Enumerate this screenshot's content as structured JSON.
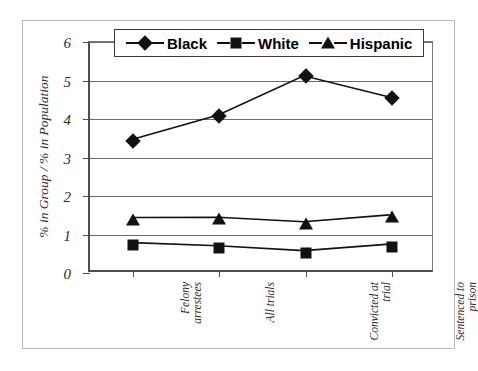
{
  "chart_data": {
    "type": "line",
    "title": "",
    "xlabel": "",
    "ylabel": "% in Group / % in Population",
    "ylim": [
      0,
      6
    ],
    "ytick_values": [
      0,
      1,
      2,
      3,
      4,
      5,
      6
    ],
    "ytick_labels": [
      "0",
      "1",
      "2",
      "3",
      "4",
      "5",
      "6"
    ],
    "grid": true,
    "legend_position": "top-center",
    "categories": [
      "Felony arrestees",
      "All trials",
      "Convicted at trial",
      "Sentenced to prison"
    ],
    "category_lines": [
      [
        "Felony",
        "arrestees"
      ],
      [
        "All trials"
      ],
      [
        "Convicted at",
        "trial"
      ],
      [
        "Sentenced to",
        "prison"
      ]
    ],
    "series": [
      {
        "name": "Black",
        "marker": "diamond",
        "color": "#111111",
        "values": [
          3.44,
          4.08,
          5.11,
          4.55
        ]
      },
      {
        "name": "White",
        "marker": "square",
        "color": "#111111",
        "values": [
          0.72,
          0.64,
          0.51,
          0.68
        ]
      },
      {
        "name": "Hispanic",
        "marker": "triangle",
        "color": "#111111",
        "values": [
          1.38,
          1.39,
          1.27,
          1.45
        ]
      }
    ]
  },
  "legend": {
    "items": [
      {
        "label": "Black",
        "marker": "diamond-marker-icon"
      },
      {
        "label": "White",
        "marker": "square-marker-icon"
      },
      {
        "label": "Hispanic",
        "marker": "triangle-marker-icon"
      }
    ]
  }
}
